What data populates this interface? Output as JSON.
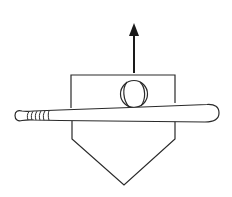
{
  "diagram": {
    "description": "Line drawing of a baseball bat lying across home plate, with a baseball resting on top of the bat and an arrow pointing upward",
    "elements": [
      {
        "name": "home-plate",
        "label": "Home plate"
      },
      {
        "name": "bat",
        "label": "Baseball bat"
      },
      {
        "name": "ball",
        "label": "Baseball"
      },
      {
        "name": "arrow",
        "label": "Upward arrow",
        "direction": "up"
      }
    ],
    "colors": {
      "stroke": "#2a2a2a",
      "background": "#ffffff"
    }
  }
}
